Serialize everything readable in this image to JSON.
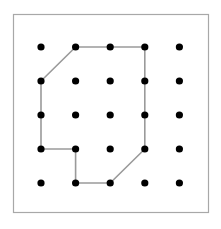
{
  "figure": {
    "name": "geoboard-polygon",
    "title": "",
    "background_color": "#ffffff"
  },
  "frame": {
    "x": 13.5,
    "y": 14.5,
    "width": 195,
    "height": 198,
    "stroke_color": "#a8a8a8",
    "stroke_width": 1.2,
    "fill_color": "#ffffff"
  },
  "grid": {
    "rows": 5,
    "cols": 5,
    "origin_x": 41,
    "origin_y": 47,
    "spacing_x": 34.6,
    "spacing_y": 34.0,
    "dot_radius": 3.6,
    "dot_color": "#000000",
    "dots": [
      {
        "row": 1,
        "col": 1,
        "x": 41,
        "y": 47
      },
      {
        "row": 1,
        "col": 2,
        "x": 75.6,
        "y": 47
      },
      {
        "row": 1,
        "col": 3,
        "x": 110.2,
        "y": 47
      },
      {
        "row": 1,
        "col": 4,
        "x": 144.8,
        "y": 47
      },
      {
        "row": 1,
        "col": 5,
        "x": 179.4,
        "y": 47
      },
      {
        "row": 2,
        "col": 1,
        "x": 41,
        "y": 81
      },
      {
        "row": 2,
        "col": 2,
        "x": 75.6,
        "y": 81
      },
      {
        "row": 2,
        "col": 3,
        "x": 110.2,
        "y": 81
      },
      {
        "row": 2,
        "col": 4,
        "x": 144.8,
        "y": 81
      },
      {
        "row": 2,
        "col": 5,
        "x": 179.4,
        "y": 81
      },
      {
        "row": 3,
        "col": 1,
        "x": 41,
        "y": 115
      },
      {
        "row": 3,
        "col": 2,
        "x": 75.6,
        "y": 115
      },
      {
        "row": 3,
        "col": 3,
        "x": 110.2,
        "y": 115
      },
      {
        "row": 3,
        "col": 4,
        "x": 144.8,
        "y": 115
      },
      {
        "row": 3,
        "col": 5,
        "x": 179.4,
        "y": 115
      },
      {
        "row": 4,
        "col": 1,
        "x": 41,
        "y": 149
      },
      {
        "row": 4,
        "col": 2,
        "x": 75.6,
        "y": 149
      },
      {
        "row": 4,
        "col": 3,
        "x": 110.2,
        "y": 149
      },
      {
        "row": 4,
        "col": 4,
        "x": 144.8,
        "y": 149
      },
      {
        "row": 4,
        "col": 5,
        "x": 179.4,
        "y": 149
      },
      {
        "row": 5,
        "col": 1,
        "x": 41,
        "y": 183
      },
      {
        "row": 5,
        "col": 2,
        "x": 75.6,
        "y": 183
      },
      {
        "row": 5,
        "col": 3,
        "x": 110.2,
        "y": 183
      },
      {
        "row": 5,
        "col": 4,
        "x": 144.8,
        "y": 183
      },
      {
        "row": 5,
        "col": 5,
        "x": 179.4,
        "y": 183
      }
    ]
  },
  "polygon": {
    "name": "rubber-band-polygon",
    "closed": true,
    "stroke_color": "#9a9a9a",
    "stroke_width": 1.6,
    "fill_color": "none",
    "vertices": [
      {
        "label": "r1c2",
        "row": 1,
        "col": 2,
        "x": 75.6,
        "y": 47
      },
      {
        "label": "r1c4",
        "row": 1,
        "col": 4,
        "x": 144.8,
        "y": 47
      },
      {
        "label": "r4c4",
        "row": 4,
        "col": 4,
        "x": 144.8,
        "y": 149
      },
      {
        "label": "r5c3",
        "row": 5,
        "col": 3,
        "x": 110.2,
        "y": 183
      },
      {
        "label": "r5c2",
        "row": 5,
        "col": 2,
        "x": 75.6,
        "y": 183
      },
      {
        "label": "r4c2",
        "row": 4,
        "col": 2,
        "x": 75.6,
        "y": 149
      },
      {
        "label": "r4c1",
        "row": 4,
        "col": 1,
        "x": 41,
        "y": 149
      },
      {
        "label": "r2c1",
        "row": 2,
        "col": 1,
        "x": 41,
        "y": 81
      }
    ],
    "path": "M 75.6 47 L 144.8 47 L 144.8 149 L 110.2 183 L 75.6 183 L 75.6 149 L 41 149 L 41 81 Z"
  }
}
